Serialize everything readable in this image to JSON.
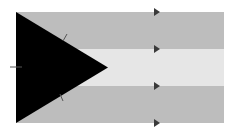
{
  "diagram": {
    "type": "flag",
    "bands": [
      {
        "name": "top-band",
        "color": "#bdbdbd"
      },
      {
        "name": "middle-band",
        "color": "#e6e6e6"
      },
      {
        "name": "bottom-band",
        "color": "#bdbdbd"
      }
    ],
    "triangle": {
      "color": "#000000"
    },
    "marker_color": "#3a3a3a",
    "tick_color": "#555555",
    "arrow_marker_count": 4,
    "tick_mark_count": 3
  }
}
